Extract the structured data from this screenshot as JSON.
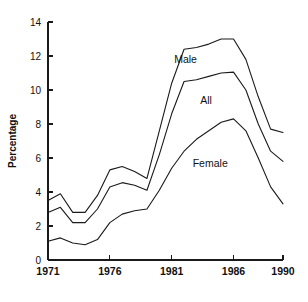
{
  "chart_data": {
    "type": "line",
    "title": "",
    "subtitle": "",
    "xlabel": "",
    "ylabel": "Percentage",
    "xlim": [
      1971,
      1990
    ],
    "ylim": [
      0,
      14
    ],
    "grid": false,
    "legend_position": "inline-annotation",
    "y_ticks": [
      0,
      2,
      4,
      6,
      8,
      10,
      12,
      14
    ],
    "y_tick_labels": [
      "0",
      "2",
      "4",
      "6",
      "8",
      "10",
      "12",
      "14"
    ],
    "x_ticks": [
      1971,
      1976,
      1981,
      1986,
      1990
    ],
    "x_tick_labels": [
      "1971",
      "1976",
      "1981",
      "1986",
      "1990"
    ],
    "x": [
      1971,
      1972,
      1973,
      1974,
      1975,
      1976,
      1977,
      1978,
      1979,
      1980,
      1981,
      1982,
      1983,
      1984,
      1985,
      1986,
      1987,
      1988,
      1989,
      1990
    ],
    "series": [
      {
        "name": "Male",
        "label": "Male",
        "values": [
          3.5,
          3.9,
          2.8,
          2.8,
          3.8,
          5.3,
          5.5,
          5.2,
          4.8,
          7.6,
          10.4,
          12.4,
          12.5,
          12.7,
          13.0,
          13.0,
          11.8,
          9.6,
          7.7,
          7.5
        ]
      },
      {
        "name": "All",
        "label": "All",
        "values": [
          2.8,
          3.1,
          2.2,
          2.2,
          3.0,
          4.3,
          4.55,
          4.4,
          4.1,
          6.2,
          8.6,
          10.5,
          10.6,
          10.8,
          11.0,
          11.05,
          10.0,
          8.0,
          6.4,
          5.8
        ]
      },
      {
        "name": "Female",
        "label": "Female",
        "values": [
          1.1,
          1.3,
          1.0,
          0.9,
          1.2,
          2.2,
          2.7,
          2.9,
          3.0,
          4.1,
          5.4,
          6.4,
          7.1,
          7.6,
          8.1,
          8.3,
          7.6,
          6.0,
          4.3,
          3.3
        ]
      }
    ],
    "annotations": [
      {
        "text": "Male",
        "x": 1981.2,
        "y": 11.6
      },
      {
        "text": "All",
        "x": 1983.3,
        "y": 9.2
      },
      {
        "text": "Female",
        "x": 1982.7,
        "y": 5.5
      }
    ],
    "colors": {
      "line": "#1a1a1a",
      "axis": "#1a1a1a",
      "text": "#111111",
      "background": "#ffffff"
    }
  }
}
